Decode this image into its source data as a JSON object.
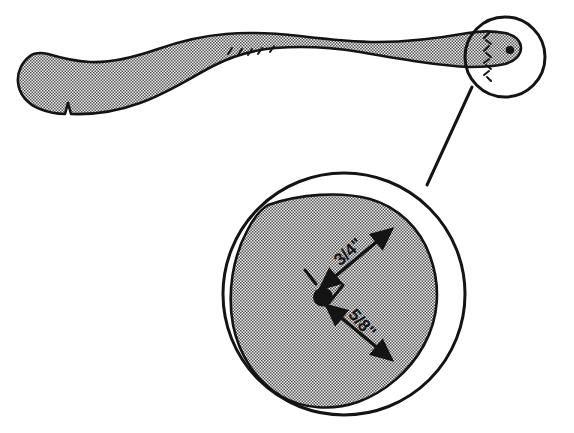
{
  "drawing": {
    "title": "Tool handle with enlarged detail view",
    "background_color": "#ffffff",
    "outline_color": "#141414",
    "fill_color": "#9a9a9a",
    "accent_color": "#141414"
  },
  "main_view": {
    "name": "handle-profile",
    "description": "Side profile of an elongated tapered tool handle, shaded with halftone stipple, with a notch at the lower left end and a small bored hole near the right end.",
    "features": {
      "notch_label": "",
      "hole_label": "",
      "knurl_marks_count": 5,
      "seam_dashes_count": 8
    }
  },
  "detail_callout": {
    "name": "detail-circle",
    "small_circle": {
      "cx": 505,
      "cy": 57,
      "r": 40
    },
    "large_circle": {
      "cx": 344,
      "cy": 294,
      "r": 121
    },
    "leader_from": {
      "x": 470,
      "y": 88
    },
    "leader_to": {
      "x": 425,
      "y": 186
    },
    "label": ""
  },
  "dimensions": [
    {
      "id": "dim-upper",
      "value": "3/4\"",
      "description": "Distance from hole center to upper right edge",
      "text_x": 352,
      "text_y": 256,
      "rotation": -42
    },
    {
      "id": "dim-lower",
      "value": "5/8\"",
      "description": "Distance from hole center to lower right edge",
      "text_x": 358,
      "text_y": 325,
      "rotation": 48
    }
  ]
}
